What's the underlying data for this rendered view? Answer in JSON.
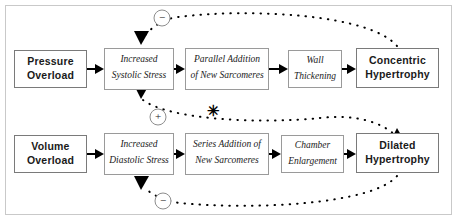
{
  "diagram": {
    "frame": {
      "x": 5,
      "y": 5,
      "width": 447,
      "height": 210,
      "color": "#c9c9c9"
    },
    "nodes": [
      {
        "id": "pressure-overload",
        "label": "Pressure\nOverload",
        "style": "bold-sans",
        "x": 14,
        "y": 50,
        "width": 73,
        "height": 38
      },
      {
        "id": "increased-systolic",
        "label": "Increased\nSystolic Stress",
        "style": "italic",
        "x": 104,
        "y": 48,
        "width": 70,
        "height": 42
      },
      {
        "id": "parallel-addition",
        "label": "Parallel Addition\nof New Sarcomeres",
        "style": "italic",
        "x": 185,
        "y": 48,
        "width": 84,
        "height": 42
      },
      {
        "id": "wall-thickening",
        "label": "Wall\nThickening",
        "style": "italic",
        "x": 288,
        "y": 50,
        "width": 54,
        "height": 38
      },
      {
        "id": "concentric-hypertrophy",
        "label": "Concentric\nHypertrophy",
        "style": "bold-sans",
        "x": 356,
        "y": 48,
        "width": 83,
        "height": 40
      },
      {
        "id": "volume-overload",
        "label": "Volume\nOverload",
        "style": "bold-sans",
        "x": 14,
        "y": 135,
        "width": 73,
        "height": 38
      },
      {
        "id": "increased-diastolic",
        "label": "Increased\nDiastolic Stress",
        "style": "italic",
        "x": 104,
        "y": 133,
        "width": 70,
        "height": 42
      },
      {
        "id": "series-addition",
        "label": "Series Addition of\nNew Sarcomeres",
        "style": "italic",
        "x": 185,
        "y": 133,
        "width": 84,
        "height": 42
      },
      {
        "id": "chamber-enlargement",
        "label": "Chamber\nEnlargement",
        "style": "italic",
        "x": 281,
        "y": 135,
        "width": 63,
        "height": 38
      },
      {
        "id": "dilated-hypertrophy",
        "label": "Dilated\nHypertrophy",
        "style": "bold-sans",
        "x": 356,
        "y": 133,
        "width": 83,
        "height": 40
      }
    ],
    "solid_links": [
      {
        "id": "link-pressure-to-systolic",
        "from": "pressure-overload",
        "to": "increased-systolic"
      },
      {
        "id": "link-systolic-to-parallel",
        "from": "increased-systolic",
        "to": "parallel-addition"
      },
      {
        "id": "link-parallel-to-wall",
        "from": "parallel-addition",
        "to": "wall-thickening"
      },
      {
        "id": "link-wall-to-concentric",
        "from": "wall-thickening",
        "to": "concentric-hypertrophy"
      },
      {
        "id": "link-volume-to-diastolic",
        "from": "volume-overload",
        "to": "increased-diastolic"
      },
      {
        "id": "link-diastolic-to-series",
        "from": "increased-diastolic",
        "to": "series-addition"
      },
      {
        "id": "link-series-to-chamber",
        "from": "series-addition",
        "to": "chamber-enlargement"
      },
      {
        "id": "link-chamber-to-dilated",
        "from": "chamber-enlargement",
        "to": "dilated-hypertrophy"
      }
    ],
    "feedback_links": [
      {
        "id": "feedback-concentric-to-systolic",
        "sign": "−",
        "sign_position": {
          "x": 162,
          "y": 18
        },
        "description": "Concentric hypertrophy inhibits increased systolic stress"
      },
      {
        "id": "feedback-dilated-to-systolic",
        "sign": "−",
        "sign_position": {
          "x": 163,
          "y": 201
        },
        "description": "Dilated hypertrophy inhibits increased diastolic stress"
      },
      {
        "id": "feedback-systolic-to-dilated",
        "sign": "+",
        "sign_position": {
          "x": 158,
          "y": 117
        },
        "description": "Diastolic stress pathway promotes dilated hypertrophy"
      }
    ],
    "markers": [
      {
        "id": "asterisk-marker",
        "glyph": "✳",
        "x": 213,
        "y": 113
      }
    ]
  }
}
